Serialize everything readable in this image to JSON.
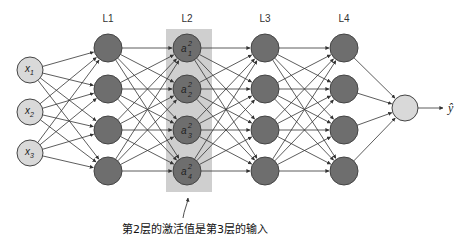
{
  "diagram": {
    "type": "neural-network",
    "layer_labels": [
      "L1",
      "L2",
      "L3",
      "L4"
    ],
    "inputs": [
      {
        "base": "x",
        "sub": "1"
      },
      {
        "base": "x",
        "sub": "2"
      },
      {
        "base": "x",
        "sub": "3"
      }
    ],
    "highlighted_layer_nodes": [
      {
        "base": "a",
        "sup": "2",
        "sub": "1"
      },
      {
        "base": "a",
        "sup": "2",
        "sub": "2"
      },
      {
        "base": "a",
        "sup": "2",
        "sub": "3"
      },
      {
        "base": "a",
        "sup": "2",
        "sub": "4"
      }
    ],
    "hidden_layers": 4,
    "nodes_per_hidden_layer": 4,
    "output_label": "ŷ",
    "caption": "第2层的激活值是第3层的输入",
    "colors": {
      "input_fill": "#d9d9d9",
      "hidden_fill": "#6e6e6e",
      "output_fill": "#d9d9d9",
      "highlight_box": "#cfcfcf",
      "stroke": "#444444",
      "edge": "#333333"
    }
  }
}
